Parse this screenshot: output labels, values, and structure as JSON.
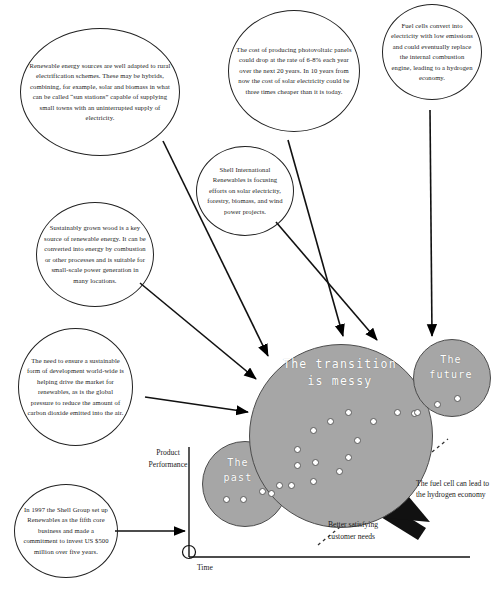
{
  "diagram": {
    "title": "The transition is messy",
    "colors": {
      "scenario_fill": "#a6a6a6",
      "scenario_stroke": "#4c4c4c",
      "dot_fill": "#ffffff",
      "bubble_stroke": "#222222",
      "arrow": "#000000",
      "text": "#1a1a1a"
    }
  },
  "bubbles": [
    {
      "id": "renewable-energy-sources",
      "text": "Renewable energy sources are well adapted to rural electrification schemes.  These may be hybrids, combining, for example, solar and biomass in what can be called “sun stations” capable of supplying small towns with an uninterrupted supply of electricity."
    },
    {
      "id": "photovoltaic-cost",
      "text": "The cost of producing photovoltaic panels could drop at the rate of 6-8% each year over the next 20 years.  In 10 years from now the cost of solar electricity could be three times cheaper than it is today."
    },
    {
      "id": "fuel-cells",
      "text": "Fuel cells convert into electricity with low emissions and could eventually replace the internal combustion engine, leading to a hydrogen economy."
    },
    {
      "id": "shell-international-renewables",
      "text": "Shell International Renewables is focusing efforts on solar electricity, forestry, biomass, and wind power projects."
    },
    {
      "id": "sustainably-grown-wood",
      "text": "Sustainably grown wood is a key source of renewable energy. It can be converted into energy by combustion or other  processes and is suitable for small-scale power generation in many locations."
    },
    {
      "id": "sustainable-development",
      "text": "The need to ensure a sustainable form of development world-wide is helping drive the market for renewables, as is the global pressure to reduce the amount of carbon dioxide emitted into the air."
    },
    {
      "id": "shell-group-1997",
      "text": "In 1997 the Shell Group set up Renewables as the fifth core business and made a commitment to invest US $500 million over five years."
    }
  ],
  "scenarios": [
    {
      "id": "the-past",
      "label_line1": "The",
      "label_line2": "past"
    },
    {
      "id": "the-transition-is-messy",
      "label_line1": "The transition",
      "label_line2": "is messy"
    },
    {
      "id": "the-future",
      "label_line1": "The",
      "label_line2": "future"
    }
  ],
  "axes": {
    "y_label_line1": "Product",
    "y_label_line2": "Performance",
    "x_label": "Time"
  },
  "annotations": {
    "trend_line1": "Better satisfying",
    "trend_line2": "customer needs",
    "fuel_cell_callout": "The fuel cell can lead to the hydrogen economy"
  }
}
